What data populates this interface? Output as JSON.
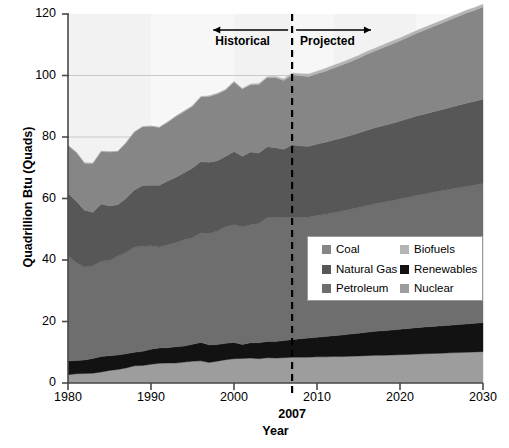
{
  "chart_data": {
    "type": "area",
    "title": "",
    "xlabel": "Year",
    "ylabel": "Quadrillion Btu (Quads)",
    "xlim": [
      1980,
      2030
    ],
    "ylim": [
      0,
      120
    ],
    "xticks": [
      1980,
      1990,
      2000,
      2010,
      2020,
      2030
    ],
    "yticks": [
      0,
      20,
      40,
      60,
      80,
      100,
      120
    ],
    "grid": "horizontal-faint",
    "legend_position": "center-right",
    "stacked": true,
    "divider": {
      "x": 2007,
      "label": "2007",
      "style": "dashed"
    },
    "annotations": [
      {
        "text": "Historical",
        "arrow": "left",
        "x_range": [
          1998,
          2007
        ]
      },
      {
        "text": "Projected",
        "arrow": "right",
        "x_range": [
          2007,
          2016
        ]
      }
    ],
    "x": [
      1980,
      1981,
      1982,
      1983,
      1984,
      1985,
      1986,
      1987,
      1988,
      1989,
      1990,
      1991,
      1992,
      1993,
      1994,
      1995,
      1996,
      1997,
      1998,
      1999,
      2000,
      2001,
      2002,
      2003,
      2004,
      2005,
      2006,
      2007,
      2008,
      2009,
      2010,
      2011,
      2012,
      2013,
      2014,
      2015,
      2016,
      2017,
      2018,
      2019,
      2020,
      2021,
      2022,
      2023,
      2024,
      2025,
      2026,
      2027,
      2028,
      2029,
      2030
    ],
    "series": [
      {
        "name": "Nuclear",
        "color": "#9d9d9d",
        "order": 1,
        "values": [
          2.7,
          3.0,
          3.1,
          3.2,
          3.6,
          4.1,
          4.4,
          4.9,
          5.6,
          5.7,
          6.1,
          6.4,
          6.5,
          6.5,
          6.8,
          7.1,
          7.2,
          6.7,
          7.1,
          7.6,
          7.9,
          8.0,
          8.1,
          7.9,
          8.2,
          8.1,
          8.2,
          8.4,
          8.4,
          8.4,
          8.5,
          8.5,
          8.6,
          8.6,
          8.7,
          8.8,
          8.9,
          9.0,
          9.0,
          9.1,
          9.2,
          9.3,
          9.4,
          9.5,
          9.6,
          9.7,
          9.8,
          9.9,
          10.0,
          10.1,
          10.2
        ]
      },
      {
        "name": "Renewables",
        "color": "#121212",
        "order": 2,
        "values": [
          4.5,
          4.3,
          4.4,
          4.8,
          5.0,
          4.8,
          4.7,
          4.6,
          4.4,
          4.6,
          4.9,
          5.0,
          5.0,
          5.3,
          5.2,
          5.5,
          6.0,
          5.7,
          5.4,
          5.3,
          5.3,
          4.5,
          5.0,
          5.2,
          5.3,
          5.4,
          5.6,
          5.7,
          6.0,
          6.2,
          6.4,
          6.6,
          6.8,
          7.0,
          7.2,
          7.4,
          7.6,
          7.8,
          8.0,
          8.1,
          8.3,
          8.4,
          8.6,
          8.7,
          8.8,
          8.9,
          9.0,
          9.1,
          9.2,
          9.3,
          9.4
        ]
      },
      {
        "name": "Petroleum",
        "color": "#6e6e6e",
        "order": 3,
        "values": [
          34.2,
          31.9,
          30.2,
          30.1,
          31.1,
          30.9,
          32.2,
          32.9,
          34.2,
          34.2,
          33.6,
          32.8,
          33.5,
          33.8,
          34.7,
          34.6,
          35.7,
          36.2,
          36.9,
          37.9,
          38.3,
          38.3,
          38.4,
          38.8,
          40.3,
          40.4,
          40.0,
          39.8,
          39.5,
          39.4,
          39.6,
          39.8,
          40.0,
          40.3,
          40.6,
          40.9,
          41.2,
          41.5,
          41.8,
          42.1,
          42.4,
          42.7,
          43.0,
          43.3,
          43.6,
          43.9,
          44.2,
          44.5,
          44.8,
          45.0,
          45.3
        ]
      },
      {
        "name": "Natural Gas",
        "color": "#575757",
        "order": 4,
        "values": [
          20.4,
          19.9,
          18.5,
          17.4,
          18.5,
          17.8,
          16.7,
          17.7,
          18.6,
          19.7,
          19.7,
          20.1,
          20.7,
          21.3,
          21.7,
          22.7,
          23.1,
          23.2,
          22.9,
          22.9,
          23.8,
          22.9,
          23.6,
          22.9,
          23.0,
          22.6,
          22.2,
          23.6,
          23.2,
          23.0,
          23.2,
          23.4,
          23.6,
          23.8,
          24.0,
          24.2,
          24.5,
          24.7,
          24.9,
          25.1,
          25.3,
          25.6,
          25.8,
          26.0,
          26.2,
          26.4,
          26.6,
          26.8,
          27.0,
          27.2,
          27.4
        ]
      },
      {
        "name": "Coal",
        "color": "#868686",
        "order": 5,
        "values": [
          15.4,
          15.9,
          15.3,
          15.9,
          17.1,
          17.5,
          17.3,
          18.0,
          18.8,
          19.1,
          19.2,
          18.8,
          19.1,
          19.8,
          19.9,
          20.1,
          21.0,
          21.4,
          21.7,
          21.6,
          22.6,
          21.9,
          21.9,
          22.3,
          22.5,
          22.8,
          22.4,
          22.7,
          22.8,
          22.7,
          22.9,
          23.1,
          23.4,
          23.7,
          24.0,
          24.3,
          24.7,
          25.0,
          25.4,
          25.8,
          26.1,
          26.5,
          26.9,
          27.3,
          27.7,
          28.1,
          28.5,
          28.9,
          29.3,
          29.6,
          30.0
        ]
      },
      {
        "name": "Biofuels",
        "color": "#b4b4b4",
        "order": 6,
        "values": [
          0.1,
          0.1,
          0.1,
          0.1,
          0.1,
          0.1,
          0.1,
          0.1,
          0.1,
          0.1,
          0.1,
          0.1,
          0.1,
          0.1,
          0.2,
          0.2,
          0.2,
          0.2,
          0.2,
          0.2,
          0.2,
          0.2,
          0.2,
          0.3,
          0.3,
          0.4,
          0.5,
          0.6,
          0.7,
          0.8,
          0.8,
          0.9,
          0.9,
          0.9,
          0.9,
          0.9,
          0.9,
          0.9,
          0.9,
          0.9,
          0.9,
          0.9,
          0.9,
          0.9,
          0.9,
          0.9,
          0.9,
          0.9,
          0.9,
          0.9,
          0.9
        ]
      }
    ]
  },
  "axis": {
    "ylabel": "Quadrillion Btu (Quads)",
    "xlabel": "Year",
    "yticks": [
      "0",
      "20",
      "40",
      "60",
      "80",
      "100",
      "120"
    ],
    "xticks": [
      "1980",
      "1990",
      "2000",
      "2010",
      "2020",
      "2030"
    ],
    "divider_label": "2007"
  },
  "annotations": {
    "historical": "Historical",
    "projected": "Projected"
  },
  "legend": {
    "entries": [
      {
        "label": "Coal",
        "color": "#868686"
      },
      {
        "label": "Biofuels",
        "color": "#b4b4b4"
      },
      {
        "label": "Natural Gas",
        "color": "#575757"
      },
      {
        "label": "Renewables",
        "color": "#121212"
      },
      {
        "label": "Petroleum",
        "color": "#6e6e6e"
      },
      {
        "label": "Nuclear",
        "color": "#9d9d9d"
      }
    ]
  }
}
